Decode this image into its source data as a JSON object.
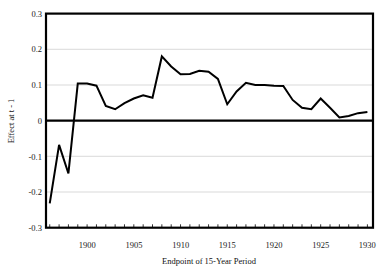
{
  "chart_data": {
    "type": "line",
    "title": "",
    "xlabel": "Endpoint of 15-Year Period",
    "ylabel": "Effect at t - 1",
    "xlim": [
      1895.6,
      1930.6
    ],
    "ylim": [
      -0.3,
      0.3
    ],
    "xticks": [
      1900,
      1905,
      1910,
      1915,
      1920,
      1925,
      1930
    ],
    "xtick_labels": [
      "1900",
      "1905",
      "1910",
      "1915",
      "1920",
      "1925",
      "1930"
    ],
    "yticks": [
      -0.3,
      -0.2,
      -0.1,
      0,
      0.1,
      0.2,
      0.3
    ],
    "ytick_labels": [
      "-0.3",
      "-0.2",
      "-0.1",
      "0",
      "0.1",
      "0.2",
      "0.3"
    ],
    "grid": true,
    "grid_axis": "y",
    "legend": "none",
    "zero_line": true,
    "series": [
      {
        "name": "Effect at t - 1",
        "x": [
          1896,
          1897,
          1898,
          1899,
          1900,
          1901,
          1902,
          1903,
          1904,
          1905,
          1906,
          1907,
          1908,
          1909,
          1910,
          1911,
          1912,
          1913,
          1914,
          1915,
          1916,
          1917,
          1918,
          1919,
          1920,
          1921,
          1922,
          1923,
          1924,
          1925,
          1926,
          1927,
          1928,
          1929,
          1930
        ],
        "values": [
          -0.232,
          -0.068,
          -0.148,
          0.104,
          0.104,
          0.098,
          0.041,
          0.032,
          0.049,
          0.062,
          0.071,
          0.064,
          0.18,
          0.152,
          0.13,
          0.131,
          0.14,
          0.137,
          0.117,
          0.046,
          0.082,
          0.106,
          0.1,
          0.1,
          0.098,
          0.097,
          0.058,
          0.036,
          0.032,
          0.062,
          0.036,
          0.009,
          0.013,
          0.021,
          0.024
        ]
      }
    ]
  },
  "axis": {
    "ylabel_text": "Effect at t - 1",
    "xlabel_text": "Endpoint of 15-Year Period"
  }
}
